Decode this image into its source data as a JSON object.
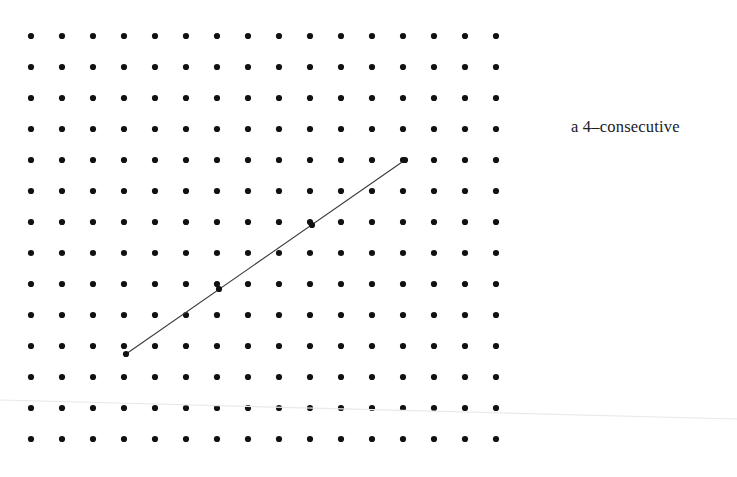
{
  "figure": {
    "background_color": "#ffffff",
    "width": 737,
    "height": 477,
    "caption": {
      "text": "a 4–consecutive",
      "x": 571,
      "y": 119
    },
    "lattice": {
      "name": "dot-grid",
      "columns": 16,
      "rows": 14,
      "origin_x": 31,
      "origin_y": 36,
      "spacing_x": 31,
      "spacing_y": 31,
      "dot_radius": 3.1,
      "dot_color": "#111111"
    },
    "segment": {
      "name": "consecutive-points-segment",
      "label": "4-consecutive",
      "color": "#3b3b3b",
      "width": 1.1,
      "x1": 126,
      "y1": 354,
      "x2": 405,
      "y2": 160,
      "marked_points": [
        {
          "x": 126,
          "y": 354
        },
        {
          "x": 219,
          "y": 289
        },
        {
          "x": 312,
          "y": 225
        },
        {
          "x": 405,
          "y": 160
        }
      ]
    },
    "scan_artifact": {
      "name": "scanner-streak",
      "color": "#e9e9ea",
      "width": 1.2,
      "x1": 0,
      "y1": 400,
      "x2": 737,
      "y2": 419
    }
  }
}
